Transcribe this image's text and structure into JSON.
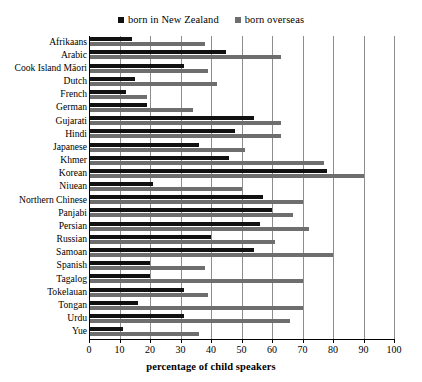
{
  "chart_data": {
    "type": "bar",
    "orientation": "horizontal",
    "title": "",
    "xlabel": "percentage of child speakers",
    "ylabel": "",
    "xlim": [
      0,
      100
    ],
    "xticks": [
      0,
      10,
      20,
      30,
      40,
      50,
      60,
      70,
      80,
      90,
      100
    ],
    "grid": true,
    "legend_position": "top-center",
    "colors": {
      "born_in_new_zealand": "#111111",
      "born_overseas": "#6e6e6e",
      "gridline": "#8d8d8d",
      "axis": "#000000",
      "background": "#ffffff"
    },
    "categories": [
      "Afrikaans",
      "Arabic",
      "Cook Island Māori",
      "Dutch",
      "French",
      "German",
      "Gujarati",
      "Hindi",
      "Japanese",
      "Khmer",
      "Korean",
      "Niuean",
      "Northern Chinese",
      "Panjabi",
      "Persian",
      "Russian",
      "Samoan",
      "Spanish",
      "Tagalog",
      "Tokelauan",
      "Tongan",
      "Urdu",
      "Yue"
    ],
    "series": [
      {
        "name": "born in New Zealand",
        "values": [
          14,
          45,
          31,
          15,
          12,
          19,
          54,
          48,
          36,
          46,
          78,
          21,
          57,
          60,
          56,
          40,
          54,
          20,
          20,
          31,
          16,
          31,
          11
        ]
      },
      {
        "name": "born overseas",
        "values": [
          38,
          63,
          39,
          42,
          19,
          34,
          63,
          63,
          51,
          77,
          90,
          50,
          70,
          67,
          72,
          61,
          80,
          38,
          70,
          39,
          70,
          66,
          36
        ]
      }
    ]
  },
  "legend": {
    "items": [
      {
        "label": "born in New Zealand",
        "swatch": "square-dark-icon"
      },
      {
        "label": "born overseas",
        "swatch": "square-gray-icon"
      }
    ]
  },
  "axis": {
    "x_title": "percentage of child speakers",
    "x_tick_labels": [
      "0",
      "10",
      "20",
      "30",
      "40",
      "50",
      "60",
      "70",
      "80",
      "90",
      "100"
    ]
  }
}
